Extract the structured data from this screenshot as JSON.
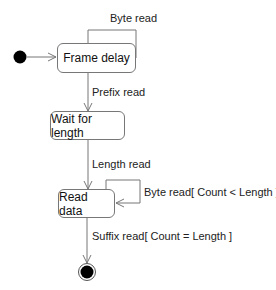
{
  "diagram": {
    "type": "uml-state-machine",
    "states": [
      {
        "id": "frame_delay",
        "label": "Frame delay"
      },
      {
        "id": "wait_for_length",
        "label": "Wait for length"
      },
      {
        "id": "read_data",
        "label": "Read data"
      }
    ],
    "transitions": [
      {
        "from": "initial",
        "to": "frame_delay",
        "label": ""
      },
      {
        "from": "frame_delay",
        "to": "frame_delay",
        "label": "Byte read"
      },
      {
        "from": "frame_delay",
        "to": "wait_for_length",
        "label": "Prefix read"
      },
      {
        "from": "wait_for_length",
        "to": "read_data",
        "label": "Length read"
      },
      {
        "from": "read_data",
        "to": "read_data",
        "label": "Byte read[ Count < Length ]"
      },
      {
        "from": "read_data",
        "to": "final",
        "label": "Suffix read[ Count = Length ]"
      }
    ],
    "colors": {
      "line": "#777777",
      "text": "#222222",
      "node_fill": "#000000"
    }
  }
}
